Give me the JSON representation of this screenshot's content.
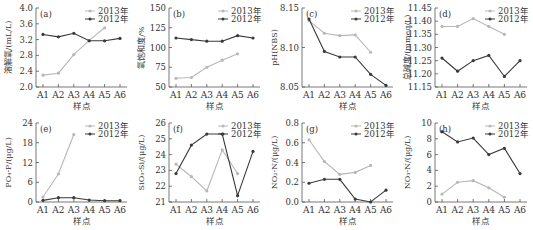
{
  "legend_labels": {
    "s2013": "2013年",
    "s2012": "2012年"
  },
  "colors": {
    "s2013": "#b8b8b8",
    "s2012": "#3a3a3a",
    "axis": "#555555"
  },
  "chart_data": [
    {
      "type": "line",
      "panel_label": "(a)",
      "ylabel": "溶解氧/(mL/L)",
      "xlabel": "样点",
      "categories": [
        "A1",
        "A2",
        "A3",
        "A4",
        "A5",
        "A6"
      ],
      "ylim": [
        2.0,
        4.0
      ],
      "yticks": [
        "2.0",
        "2.4",
        "2.8",
        "3.2",
        "3.6",
        "4.0"
      ],
      "series": [
        {
          "name": "2013年",
          "values": [
            2.3,
            2.35,
            2.82,
            3.18,
            3.5,
            null
          ]
        },
        {
          "name": "2012年",
          "values": [
            3.33,
            3.27,
            3.36,
            3.17,
            3.17,
            3.23
          ]
        }
      ],
      "legend_position": "top-right",
      "grid": false
    },
    {
      "type": "line",
      "panel_label": "(b)",
      "ylabel": "氧饱和度/%",
      "xlabel": "样点",
      "categories": [
        "A1",
        "A2",
        "A3",
        "A4",
        "A5",
        "A6"
      ],
      "ylim": [
        50,
        150
      ],
      "yticks": [
        "50",
        "75",
        "100",
        "125",
        "150"
      ],
      "series": [
        {
          "name": "2013年",
          "values": [
            61,
            62,
            75,
            84,
            92,
            null
          ]
        },
        {
          "name": "2012年",
          "values": [
            112,
            110,
            108,
            108,
            115,
            112
          ]
        }
      ],
      "legend_position": "top-right",
      "grid": false
    },
    {
      "type": "line",
      "panel_label": "(c)",
      "ylabel": "pH(NBS)",
      "xlabel": "样点",
      "categories": [
        "A1",
        "A2",
        "A3",
        "A4",
        "A5",
        "A6"
      ],
      "ylim": [
        8.05,
        8.15
      ],
      "yticks": [
        "8.05",
        "8.10",
        "8.15"
      ],
      "series": [
        {
          "name": "2013年",
          "values": [
            8.134,
            8.118,
            8.115,
            8.116,
            8.094,
            null
          ]
        },
        {
          "name": "2012年",
          "values": [
            8.136,
            8.095,
            8.088,
            8.088,
            8.066,
            8.052
          ]
        }
      ],
      "legend_position": "top-right",
      "grid": false
    },
    {
      "type": "line",
      "panel_label": "(d)",
      "ylabel": "总碱度/(mmeq/L)",
      "xlabel": "样点",
      "categories": [
        "A1",
        "A2",
        "A3",
        "A4",
        "A5",
        "A6"
      ],
      "ylim": [
        11.15,
        11.45
      ],
      "yticks": [
        "11.15",
        "11.20",
        "11.25",
        "11.30",
        "11.35",
        "11.40",
        "11.45"
      ],
      "series": [
        {
          "name": "2013年",
          "values": [
            11.38,
            11.38,
            11.41,
            11.38,
            11.35,
            null
          ]
        },
        {
          "name": "2012年",
          "values": [
            11.26,
            11.21,
            11.25,
            11.27,
            11.19,
            11.25
          ]
        }
      ],
      "legend_position": "top-right",
      "grid": false
    },
    {
      "type": "line",
      "panel_label": "(e)",
      "ylabel": "PO₄-P/(μg/L)",
      "xlabel": "样点",
      "categories": [
        "A1",
        "A2",
        "A3",
        "A4",
        "A5",
        "A6"
      ],
      "ylim": [
        0,
        24
      ],
      "yticks": [
        "0",
        "6",
        "12",
        "18",
        "24"
      ],
      "series": [
        {
          "name": "2013年",
          "values": [
            1.5,
            8.5,
            20.5,
            null,
            null,
            null
          ]
        },
        {
          "name": "2012年",
          "values": [
            0.5,
            1.3,
            1.3,
            0.6,
            0.4,
            0.4
          ]
        }
      ],
      "legend_position": "top-right",
      "grid": false
    },
    {
      "type": "line",
      "panel_label": "(f)",
      "ylabel": "SiO₃-Si/(μg/L)",
      "xlabel": "样点",
      "categories": [
        "A1",
        "A2",
        "A3",
        "A4",
        "A5",
        "A6"
      ],
      "ylim": [
        21,
        26
      ],
      "yticks": [
        "21",
        "22",
        "23",
        "24",
        "25",
        "26"
      ],
      "series": [
        {
          "name": "2013年",
          "values": [
            23.4,
            22.6,
            21.7,
            24.3,
            22.8,
            null
          ]
        },
        {
          "name": "2012年",
          "values": [
            22.8,
            24.6,
            25.3,
            25.3,
            21.4,
            24.2
          ]
        }
      ],
      "legend_position": "top-right",
      "grid": false
    },
    {
      "type": "line",
      "panel_label": "(g)",
      "ylabel": "NO₂-N/(μg/L)",
      "xlabel": "样点",
      "categories": [
        "A1",
        "A2",
        "A3",
        "A4",
        "A5",
        "A6"
      ],
      "ylim": [
        0.0,
        0.8
      ],
      "yticks": [
        "0.0",
        "0.2",
        "0.4",
        "0.6",
        "0.8"
      ],
      "series": [
        {
          "name": "2013年",
          "values": [
            0.63,
            0.41,
            0.28,
            0.3,
            0.37,
            null
          ]
        },
        {
          "name": "2012年",
          "values": [
            0.19,
            0.23,
            0.23,
            0.03,
            0.0,
            0.12
          ]
        }
      ],
      "legend_position": "top-right",
      "grid": false
    },
    {
      "type": "line",
      "panel_label": "(h)",
      "ylabel": "NO₃-N/(μg/L)",
      "xlabel": "样点",
      "categories": [
        "A1",
        "A2",
        "A3",
        "A4",
        "A5",
        "A6"
      ],
      "ylim": [
        0,
        10
      ],
      "yticks": [
        "0",
        "2",
        "4",
        "6",
        "8",
        "10"
      ],
      "series": [
        {
          "name": "2013年",
          "values": [
            1.0,
            2.5,
            2.7,
            1.8,
            0.6,
            null
          ]
        },
        {
          "name": "2012年",
          "values": [
            8.9,
            7.6,
            8.1,
            6.0,
            6.8,
            3.6
          ]
        }
      ],
      "legend_position": "top-right",
      "grid": false
    }
  ]
}
